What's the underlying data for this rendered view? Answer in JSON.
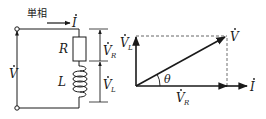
{
  "circuit": {
    "title_label": "単相",
    "current_label": "I",
    "source_voltage_label": "V",
    "resistor_label": "R",
    "inductor_label": "L",
    "vr_label": "V",
    "vr_sub": "R",
    "vl_label": "V",
    "vl_sub": "L"
  },
  "phasor": {
    "vl_label": "V",
    "vl_sub": "L",
    "v_label": "V",
    "angle_label": "θ",
    "vr_label": "V",
    "vr_sub": "R",
    "current_label": "I"
  },
  "colors": {
    "line": "#1a1a1a",
    "dashed": "#555555",
    "background": "#ffffff"
  }
}
